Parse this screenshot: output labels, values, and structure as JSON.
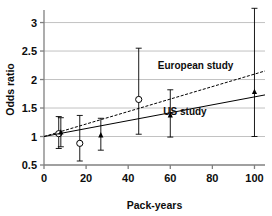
{
  "chart_data": {
    "type": "scatter",
    "title": "",
    "xlabel": "Pack-years",
    "ylabel": "Odds ratio",
    "xlim": [
      0,
      105
    ],
    "ylim": [
      0.5,
      3.15
    ],
    "xticks": [
      0,
      20,
      40,
      60,
      80,
      100
    ],
    "xtick_labels": [
      "0",
      "20",
      "40",
      "60",
      "80",
      "100"
    ],
    "yticks": [
      0.5,
      1,
      1.5,
      2,
      2.5,
      3
    ],
    "ytick_labels": [
      "0.5",
      "1",
      "1.5",
      "2",
      "2.5",
      "3"
    ],
    "grid": "horizontal",
    "legend_position": "inline-annotations",
    "series": [
      {
        "name": "European study",
        "marker": "open-circle",
        "line_style": "dashed",
        "annotation": "European study",
        "annotation_x": 72,
        "annotation_y": 2.18,
        "fit_line": {
          "x0": 0,
          "y0": 1.0,
          "x1": 105,
          "y1": 2.15
        },
        "points": [
          {
            "x": 7,
            "y": 1.05,
            "low": 0.79,
            "high": 1.35
          },
          {
            "x": 17,
            "y": 0.88,
            "low": 0.57,
            "high": 1.37
          },
          {
            "x": 45,
            "y": 1.65,
            "low": 1.04,
            "high": 2.55
          }
        ]
      },
      {
        "name": "US study",
        "marker": "filled-triangle",
        "line_style": "solid",
        "annotation": "US study",
        "annotation_x": 67,
        "annotation_y": 1.37,
        "fit_line": {
          "x0": 0,
          "y0": 1.0,
          "x1": 105,
          "y1": 1.73
        },
        "points": [
          {
            "x": 8,
            "y": 1.07,
            "low": 0.82,
            "high": 1.33
          },
          {
            "x": 27,
            "y": 1.02,
            "low": 0.76,
            "high": 1.32
          },
          {
            "x": 60,
            "y": 1.37,
            "low": 0.99,
            "high": 1.82
          },
          {
            "x": 100,
            "y": 1.78,
            "low": 1.0,
            "high": 3.25
          }
        ]
      }
    ],
    "colors": {
      "line": "#000000",
      "marker": "#000000",
      "grid": "#b3b3b3",
      "axis": "#808080",
      "text": "#0d0d0d",
      "background": "#ffffff"
    }
  }
}
